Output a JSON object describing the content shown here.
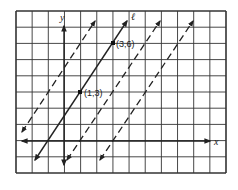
{
  "chart_data": {
    "type": "line",
    "title": "",
    "xlabel": "x",
    "ylabel": "y",
    "grid": true,
    "xlim": [
      -3,
      10
    ],
    "ylim": [
      -2,
      8
    ],
    "line_label": "ℓ",
    "series": [
      {
        "name": "dashed-left",
        "style": "dashed",
        "slope": 1.5,
        "x_intercept": -3,
        "x": [
          -3,
          1
        ],
        "y": [
          0,
          6
        ]
      },
      {
        "name": "ℓ",
        "style": "solid",
        "slope": 1.5,
        "x_intercept": -1,
        "x": [
          1,
          3
        ],
        "y": [
          3,
          6
        ],
        "points": [
          {
            "label": "(1,3)",
            "x": 1,
            "y": 3
          },
          {
            "label": "(3,6)",
            "x": 3,
            "y": 6
          }
        ]
      },
      {
        "name": "dashed-middle",
        "style": "dashed",
        "slope": 1.5,
        "x_intercept": 1,
        "x": [
          1,
          5
        ],
        "y": [
          0,
          6
        ]
      },
      {
        "name": "dashed-right",
        "style": "dashed",
        "slope": 1.5,
        "x_intercept": 3,
        "x": [
          3,
          7
        ],
        "y": [
          0,
          6
        ]
      }
    ]
  },
  "labels": {
    "x_axis": "x",
    "y_axis": "y",
    "line": "ℓ",
    "point_a": "(1,3)",
    "point_b": "(3,6)"
  }
}
